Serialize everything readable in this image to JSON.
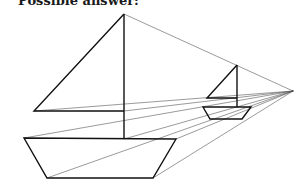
{
  "caption": "Possible answer:",
  "figure": {
    "vanishing_point": [
      293,
      91
    ],
    "large_boat": {
      "sail": [
        [
          124,
          14
        ],
        [
          34,
          111
        ],
        [
          124,
          111
        ]
      ],
      "mast": [
        [
          124,
          14
        ],
        [
          124,
          139
        ]
      ],
      "hull": [
        [
          24,
          138
        ],
        [
          176,
          139
        ],
        [
          153,
          178
        ],
        [
          47,
          178
        ]
      ]
    },
    "small_boat": {
      "sail": [
        [
          237,
          65
        ],
        [
          207,
          98
        ],
        [
          237,
          98
        ]
      ],
      "mast": [
        [
          237,
          65
        ],
        [
          237,
          107
        ]
      ],
      "hull": [
        [
          203,
          107
        ],
        [
          251,
          107
        ],
        [
          242,
          119
        ],
        [
          210,
          119
        ]
      ]
    },
    "colors": {
      "line": "#111111",
      "guide": "#555555",
      "background": "#ffffff"
    }
  }
}
